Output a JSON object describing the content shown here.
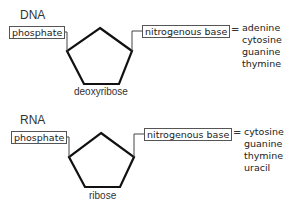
{
  "panels": [
    {
      "title": "DNA",
      "phosphate_label": "phosphate",
      "base_label": "nitrogenous base",
      "equals": "=",
      "sugar_label": "deoxyribose",
      "bases": [
        "adenine",
        "cytosine",
        "guanine",
        "thymine"
      ]
    },
    {
      "title": "RNA",
      "phosphate_label": "phosphate",
      "base_label": "nitrogenous base",
      "equals": "=",
      "sugar_label": "ribose",
      "bases": [
        "cytosine",
        "guanine",
        "thymine",
        "uracil"
      ]
    }
  ]
}
